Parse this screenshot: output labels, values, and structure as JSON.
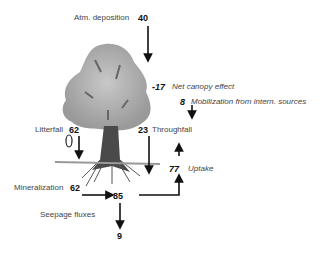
{
  "diagram": {
    "type": "nutrient-flux",
    "flows": [
      {
        "label": "Atm. deposition",
        "value": "40"
      },
      {
        "label": "Net canopy effect",
        "value": "-17"
      },
      {
        "label": "Mobilization from intern. sources",
        "value": "8"
      },
      {
        "label": "Litterfall",
        "value": "62"
      },
      {
        "label": "Throughfall",
        "value": "23"
      },
      {
        "label": "Uptake",
        "value": "77"
      },
      {
        "label": "Mineralization",
        "value": "62"
      },
      {
        "label": "Soil pool",
        "value": "85"
      },
      {
        "label": "Seepage fluxes",
        "value": "9"
      }
    ]
  },
  "labels": {
    "atm": "Atm. deposition",
    "canopy": "Net canopy effect",
    "mobil": "Mobilization from intern. sources",
    "litter": "Litterfall",
    "through": "Throughfall",
    "uptake": "Uptake",
    "mineral": "Mineralization",
    "seepage": "Seepage fluxes"
  },
  "values": {
    "atm": "40",
    "canopy": "-17",
    "mobil": "8",
    "litter": "62",
    "through": "23",
    "uptake": "77",
    "mineral": "62",
    "pool": "85",
    "seepage": "9"
  }
}
